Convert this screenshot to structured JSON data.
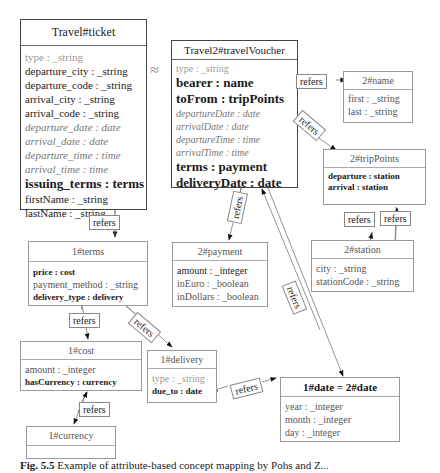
{
  "diagram": {
    "approx_symbol": "≈",
    "refers_label": "refers",
    "boxes": {
      "ticket": {
        "title": "Travel#ticket",
        "attrs": [
          "type : _string",
          "departure_city : _string",
          "departure_code : _string",
          "arrival_city : _string",
          "arrival_code : _string",
          "departure_date : date",
          "arrival_date : date",
          "departure_time : time",
          "arrival_time : time",
          "issuing_terms : terms",
          "firstName : _string",
          "lastName : _string"
        ]
      },
      "voucher": {
        "title": "Travel2#travelVoucher",
        "attrs": [
          "type : _string",
          "bearer : name",
          "toFrom : tripPoints",
          "departureDate : date",
          "arrivalDate : date",
          "departureTime : time",
          "arrivalTime : time",
          "terms : payment",
          "deliveryDate : date"
        ]
      },
      "name": {
        "title": "2#name",
        "attrs": [
          "first : _string",
          "last : _string"
        ]
      },
      "tripPoints": {
        "title": "2#tripPoints",
        "attrs": [
          "departure : station",
          "arrival : station"
        ]
      },
      "station": {
        "title": "2#station",
        "attrs": [
          "city : _string",
          "stationCode : _string"
        ]
      },
      "payment": {
        "title": "2#payment",
        "attrs": [
          "amount : _integer",
          "inEuro : _boolean",
          "inDollars : _boolean"
        ]
      },
      "terms": {
        "title": "1#terms",
        "attrs": [
          "price : cost",
          "payment_method : _string",
          "delivery_type : delivery"
        ]
      },
      "cost": {
        "title": "1#cost",
        "attrs": [
          "amount : _integer",
          "hasCurrency : currency"
        ]
      },
      "delivery": {
        "title": "1#delivery",
        "attrs": [
          "type : _string",
          "due_to : date"
        ]
      },
      "currency": {
        "title": "1#currency",
        "attrs": []
      },
      "date": {
        "title": "1#date = 2#date",
        "attrs": [
          "year : _integer",
          "month : _integer",
          "day : _integer"
        ]
      }
    },
    "caption": {
      "label": "Fig. 5.5",
      "text": "Example of attribute-based concept mapping by Pohs and Z..."
    }
  }
}
